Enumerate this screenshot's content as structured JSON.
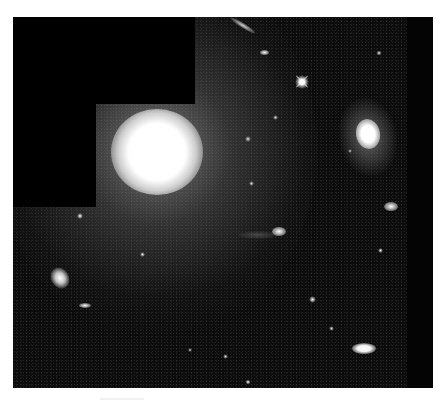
{
  "image": {
    "subject": "deep-field galaxy cluster astronomical photograph",
    "background_color": "#ffffff",
    "sky_color": "#0c0c0c",
    "mask_color": "#000000",
    "features": [
      {
        "name": "giant-elliptical-galaxy",
        "cx": 157,
        "cy": 150,
        "rx": 38,
        "ry": 36
      },
      {
        "name": "spiral-galaxy",
        "cx": 367,
        "cy": 132,
        "rx": 17,
        "ry": 28
      },
      {
        "name": "edge-on-galaxy-top",
        "cx": 242,
        "cy": 27
      },
      {
        "name": "bright-star",
        "cx": 302,
        "cy": 82
      },
      {
        "name": "elliptical-galaxy-left",
        "cx": 60,
        "cy": 279
      },
      {
        "name": "galaxy-bottom-right",
        "cx": 365,
        "cy": 349
      },
      {
        "name": "interacting-pair",
        "cx": 279,
        "cy": 233
      }
    ]
  }
}
